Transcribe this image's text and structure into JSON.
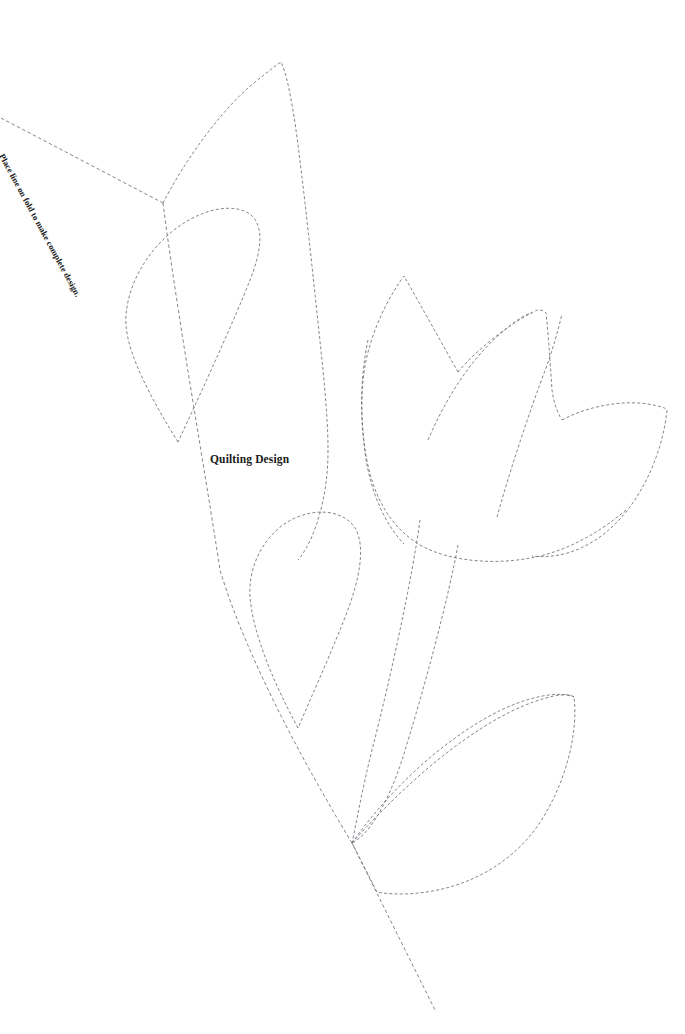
{
  "document": {
    "type": "quilting-pattern-template",
    "background_color": "#ffffff",
    "width": 685,
    "height": 1034
  },
  "labels": {
    "title": "Quilting Design",
    "fold_instruction": "Place line on fold to make complete design."
  },
  "style": {
    "stitch_line_color": "#6e6e78",
    "fold_line_color": "#6e6e78",
    "text_color": "#1a1a1a",
    "dash_pattern": "3 2.2"
  },
  "shapes": {
    "fold_line": {
      "name": "fold-line",
      "d": "M 1 118 L 163 203 M 163 203 L 220 570 L 352 843 L 436 1012"
    },
    "fold_line_upper": {
      "name": "fold-line-upper-segment",
      "d": "M 1 118 L 163 203"
    },
    "fold_line_lower": {
      "name": "fold-line-lower-segment",
      "d": "M 163 203 C 178 320 205 470 220 570 C 250 670 320 790 352 843 L 436 1012"
    },
    "top_petal": {
      "name": "top-petal",
      "d": "M 163 203 C 180 170 215 115 255 82 C 268 72 276 65 281 62 C 286 72 291 95 296 130 C 303 180 313 275 322 360 C 330 440 330 470 322 505 C 315 535 305 552 298 560"
    },
    "upper_left_leaf": {
      "name": "upper-left-leaf",
      "d": "M 178 442 C 152 400 128 356 126 325 C 124 290 146 250 178 227 C 206 207 236 203 251 215 C 264 226 262 250 250 280 C 236 316 206 382 178 442"
    },
    "middle_left_leaf": {
      "name": "middle-left-leaf",
      "d": "M 298 728 C 272 680 252 630 250 596 C 248 562 268 530 295 518 C 320 507 345 512 355 528 C 366 546 360 580 344 620 C 328 660 310 700 298 728"
    },
    "flower_left_petal": {
      "name": "tulip-left-petal",
      "d": "M 458 372 C 440 340 420 304 404 276 C 392 292 378 318 370 345 C 360 378 360 415 365 452 C 370 492 385 524 404 544"
    },
    "flower_body_left": {
      "name": "tulip-body-left-edge",
      "d": "M 368 340 C 360 378 360 418 366 456 C 374 500 392 528 420 545"
    },
    "flower_center_petal": {
      "name": "tulip-center-petal",
      "d": "M 458 372 C 478 348 510 324 533 312 C 540 308 544 311 546 313 C 548 330 550 360 552 390 C 554 404 558 414 562 420"
    },
    "flower_center_inner": {
      "name": "tulip-center-inner-edge",
      "d": "M 428 440 C 445 400 470 360 500 334 C 516 320 526 314 532 313"
    },
    "flower_mid_vein": {
      "name": "tulip-mid-vein",
      "d": "M 497 517 C 510 470 530 410 546 368 C 556 340 560 322 562 314"
    },
    "flower_right_petal": {
      "name": "tulip-right-petal",
      "d": "M 562 420 C 588 406 622 400 648 404 C 660 406 666 408 667 410 C 664 442 650 482 626 512 C 600 544 566 560 532 556"
    },
    "flower_bottom": {
      "name": "tulip-bottom-arc",
      "d": "M 420 545 C 450 562 498 566 540 556 C 572 548 600 532 626 510"
    },
    "stem_left": {
      "name": "stem-left-line",
      "d": "M 420 520 C 412 580 390 680 372 750 C 362 790 356 825 352 843"
    },
    "stem_right": {
      "name": "stem-right-line",
      "d": "M 458 545 C 448 600 424 690 402 760 C 386 808 368 835 352 843"
    },
    "bottom_right_leaf": {
      "name": "bottom-right-leaf",
      "d": "M 352 843 C 390 800 450 742 510 712 C 545 695 568 692 574 697 C 578 730 568 776 544 816 C 518 860 468 892 404 894 C 390 894 380 893 377 892 Z"
    },
    "bottom_right_leaf_inner": {
      "name": "bottom-right-leaf-inner-edge",
      "d": "M 352 843 C 382 800 430 750 486 718 C 528 694 562 691 574 697"
    }
  }
}
